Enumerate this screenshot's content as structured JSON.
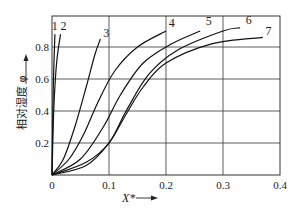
{
  "chart_data": {
    "type": "line",
    "title": "",
    "xlabel": "X*",
    "ylabel": "相对湿度 φ",
    "xlim": [
      0,
      0.4
    ],
    "ylim": [
      0,
      1.0
    ],
    "grid": true,
    "xticks": [
      "0",
      "0.1",
      "0.2",
      "0.3",
      "0.4"
    ],
    "yticks": [
      "0.2",
      "0.4",
      "0.6",
      "0.8"
    ],
    "legend": "inline curve labels 1-7",
    "series": [
      {
        "name": "1",
        "x": [
          0,
          0.002,
          0.005
        ],
        "y": [
          0,
          0.5,
          0.88
        ]
      },
      {
        "name": "2",
        "x": [
          0,
          0.003,
          0.008,
          0.015
        ],
        "y": [
          0,
          0.4,
          0.7,
          0.88
        ]
      },
      {
        "name": "3",
        "x": [
          0,
          0.02,
          0.04,
          0.06,
          0.075,
          0.085
        ],
        "y": [
          0,
          0.1,
          0.3,
          0.55,
          0.75,
          0.85
        ]
      },
      {
        "name": "4",
        "x": [
          0,
          0.03,
          0.055,
          0.08,
          0.11,
          0.15,
          0.2
        ],
        "y": [
          0,
          0.1,
          0.25,
          0.45,
          0.65,
          0.8,
          0.9
        ]
      },
      {
        "name": "5",
        "x": [
          0,
          0.05,
          0.09,
          0.12,
          0.16,
          0.21,
          0.26
        ],
        "y": [
          0,
          0.1,
          0.3,
          0.5,
          0.7,
          0.82,
          0.9
        ]
      },
      {
        "name": "6",
        "x": [
          0,
          0.06,
          0.1,
          0.13,
          0.17,
          0.22,
          0.3,
          0.33
        ],
        "y": [
          0,
          0.08,
          0.2,
          0.4,
          0.63,
          0.78,
          0.9,
          0.92
        ]
      },
      {
        "name": "7",
        "x": [
          0,
          0.06,
          0.1,
          0.13,
          0.16,
          0.2,
          0.28,
          0.37
        ],
        "y": [
          0,
          0.06,
          0.2,
          0.38,
          0.55,
          0.7,
          0.82,
          0.86
        ]
      }
    ],
    "labels": [
      {
        "text": "1",
        "x": 0.005,
        "y": 0.93
      },
      {
        "text": "2",
        "x": 0.02,
        "y": 0.93
      },
      {
        "text": "3",
        "x": 0.095,
        "y": 0.89
      },
      {
        "text": "4",
        "x": 0.21,
        "y": 0.95
      },
      {
        "text": "5",
        "x": 0.275,
        "y": 0.96
      },
      {
        "text": "6",
        "x": 0.345,
        "y": 0.97
      },
      {
        "text": "7",
        "x": 0.38,
        "y": 0.9
      }
    ]
  },
  "axes": {
    "x_label": "X*",
    "y_label": "相对湿度 φ",
    "origin": "0"
  }
}
